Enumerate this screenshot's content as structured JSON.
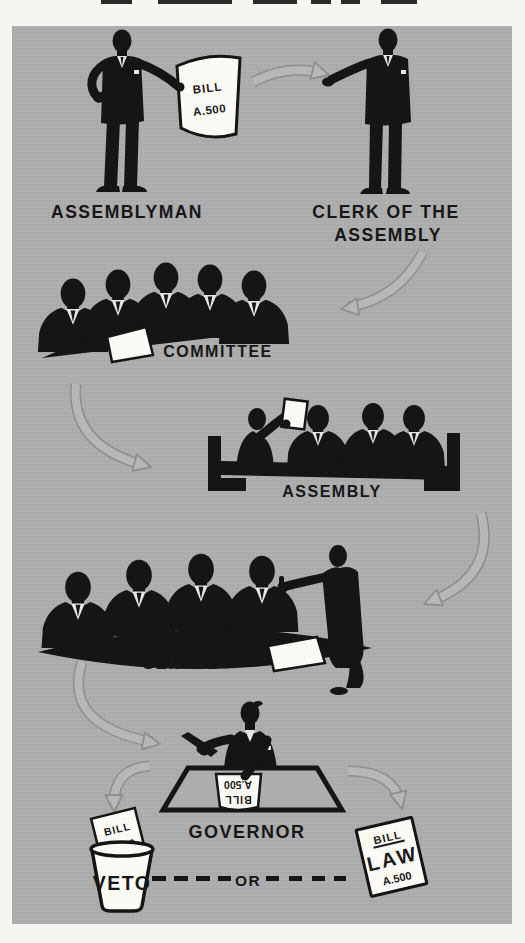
{
  "colors": {
    "page_background": "#f6f5f1",
    "panel_background": "#adadad",
    "silhouette": "#151515",
    "paper": "#fbfaf5",
    "arrow_outline": "#8e8e8e",
    "arrow_fill": "#b7b7b7"
  },
  "steps": [
    {
      "id": "assemblyman",
      "label": "ASSEMBLYMAN"
    },
    {
      "id": "clerk",
      "label": "CLERK OF THE ASSEMBLY",
      "label_lines": [
        "CLERK OF THE",
        "ASSEMBLY"
      ]
    },
    {
      "id": "committee",
      "label": "COMMITTEE"
    },
    {
      "id": "assembly",
      "label": "ASSEMBLY"
    },
    {
      "id": "senate",
      "label": "SENATE"
    },
    {
      "id": "governor",
      "label": "GOVERNOR"
    }
  ],
  "outcomes": {
    "veto_label": "VETO",
    "or_label": "OR"
  },
  "papers": {
    "bill": {
      "line1": "BILL",
      "line2": "A.500"
    },
    "governor_desk_bill": {
      "line1": "BILL",
      "line2": "A.500",
      "orientation": "upside-down"
    },
    "veto_bill": {
      "line1": "BILL",
      "line2": "A.500"
    },
    "law": {
      "line1": "BILL",
      "line2": "LAW",
      "line3": "A.500"
    }
  },
  "arrows": [
    {
      "from": "assemblyman-bill",
      "to": "clerk"
    },
    {
      "from": "clerk",
      "to": "committee"
    },
    {
      "from": "committee",
      "to": "assembly"
    },
    {
      "from": "assembly",
      "to": "senate"
    },
    {
      "from": "senate",
      "to": "governor"
    },
    {
      "from": "governor",
      "to": "veto"
    },
    {
      "from": "governor",
      "to": "law"
    }
  ]
}
